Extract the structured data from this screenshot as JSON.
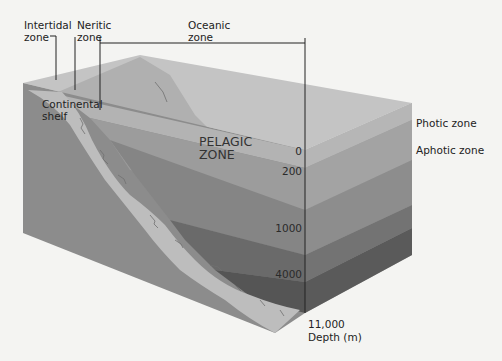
{
  "diagram": {
    "colors": {
      "background": "#f4f4f2",
      "top_surface_light": "#c9c9c9",
      "top_ridge": "#b2b2b2",
      "shelf": "#bdbdbd",
      "front_face": "#8e8e8e",
      "band_photic": "#b6b6b6",
      "band_aphotic_1": "#a0a0a0",
      "band_bathyal": "#8a8a8a",
      "band_abyssal": "#6f6f6f",
      "band_hadal": "#575757",
      "leader_line": "#222222"
    },
    "top_labels": {
      "intertidal": "Intertidal\nzone",
      "neritic": "Neritic\nzone",
      "oceanic": "Oceanic\nzone"
    },
    "side_labels": {
      "photic": "Photic zone",
      "aphotic": "Aphotic zone"
    },
    "inner_labels": {
      "continental_shelf": "Continental\nshelf",
      "pelagic": "PELAGIC\nZONE"
    },
    "depth_axis": {
      "ticks": [
        "0",
        "200",
        "1000",
        "4000"
      ],
      "bottom_value": "11,000",
      "unit_label": "Depth (m)"
    }
  }
}
